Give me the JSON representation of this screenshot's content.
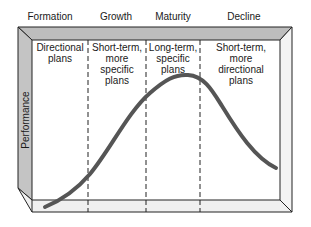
{
  "diagram": {
    "stages": [
      {
        "label": "Formation",
        "x": 50
      },
      {
        "label": "Growth",
        "x": 116
      },
      {
        "label": "Maturity",
        "x": 173
      },
      {
        "label": "Decline",
        "x": 244
      }
    ],
    "columns": [
      {
        "lines": [
          "Directional",
          "plans"
        ],
        "x": 60
      },
      {
        "lines": [
          "Short-term,",
          "more",
          "specific",
          "plans"
        ],
        "x": 117
      },
      {
        "lines": [
          "Long-term,",
          "specific",
          "plans"
        ],
        "x": 173
      },
      {
        "lines": [
          "Short-term,",
          "more",
          "directional",
          "plans"
        ],
        "x": 241
      }
    ],
    "y_axis_label": "Performance",
    "colors": {
      "frame_shade": "#bdbdbd",
      "frame_light": "#f0f0f0",
      "curve": "#555555",
      "line": "#222222"
    }
  }
}
